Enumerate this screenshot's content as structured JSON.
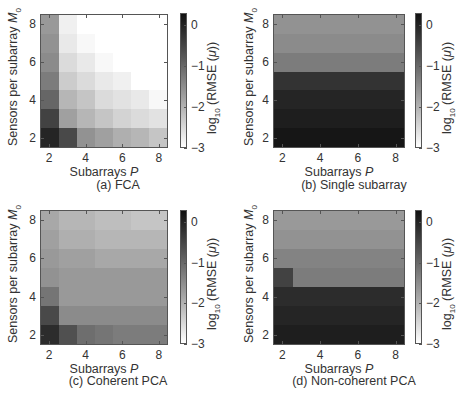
{
  "chart_data": [
    {
      "type": "heatmap",
      "title": "(a) FCA",
      "xlabel": "Subarrays P",
      "ylabel": "Sensors per subarray M0",
      "x": [
        2,
        3,
        4,
        5,
        6,
        7,
        8
      ],
      "y_rows_top_to_bottom": [
        8,
        7,
        6,
        5,
        4,
        3,
        2
      ],
      "xticks": [
        "2",
        "4",
        "6",
        "8"
      ],
      "yticks": [
        "8",
        "6",
        "4",
        "2"
      ],
      "colorbar": {
        "label": "log10 (RMSE (μ))",
        "ticks": [
          "0",
          "−1",
          "−2",
          "−3"
        ],
        "range": [
          -3,
          0.3
        ]
      },
      "values": [
        [
          -1.6,
          -2.8,
          -3.0,
          -3.0,
          -3.0,
          -3.0,
          -3.0
        ],
        [
          -1.5,
          -2.7,
          -2.9,
          -3.0,
          -3.0,
          -3.0,
          -3.0
        ],
        [
          -1.4,
          -2.5,
          -2.7,
          -2.9,
          -3.0,
          -3.0,
          -3.0
        ],
        [
          -1.2,
          -2.3,
          -2.5,
          -2.7,
          -2.8,
          -3.0,
          -3.0
        ],
        [
          -0.9,
          -2.0,
          -2.2,
          -2.5,
          -2.6,
          -2.7,
          -2.9
        ],
        [
          -0.4,
          -1.7,
          -2.0,
          -2.2,
          -2.4,
          -2.5,
          -2.6
        ],
        [
          0.0,
          -0.5,
          -1.5,
          -1.7,
          -1.9,
          -2.0,
          -2.2
        ]
      ]
    },
    {
      "type": "heatmap",
      "title": "(b) Single subarray",
      "xlabel": "Subarrays P",
      "ylabel": "Sensors per subarray M0",
      "x": [
        2,
        3,
        4,
        5,
        6,
        7,
        8
      ],
      "y_rows_top_to_bottom": [
        8,
        7,
        6,
        5,
        4,
        3,
        2
      ],
      "xticks": [
        "2",
        "4",
        "6",
        "8"
      ],
      "yticks": [
        "8",
        "6",
        "4",
        "2"
      ],
      "colorbar": {
        "label": "log10 (RMSE (μ))",
        "ticks": [
          "0",
          "−1",
          "−2",
          "−3"
        ],
        "range": [
          -3,
          0.3
        ]
      },
      "values": [
        [
          -1.5,
          -1.5,
          -1.5,
          -1.5,
          -1.5,
          -1.5,
          -1.5
        ],
        [
          -1.4,
          -1.4,
          -1.4,
          -1.4,
          -1.4,
          -1.4,
          -1.4
        ],
        [
          -1.2,
          -1.2,
          -1.2,
          -1.2,
          -1.2,
          -1.2,
          -1.2
        ],
        [
          -0.2,
          -0.2,
          -0.2,
          -0.2,
          -0.2,
          -0.2,
          -0.2
        ],
        [
          0.0,
          0.0,
          0.0,
          0.0,
          0.0,
          0.0,
          0.0
        ],
        [
          0.1,
          0.1,
          0.1,
          0.1,
          0.1,
          0.1,
          0.1
        ],
        [
          0.2,
          0.2,
          0.2,
          0.2,
          0.2,
          0.2,
          0.2
        ]
      ]
    },
    {
      "type": "heatmap",
      "title": "(c) Coherent PCA",
      "xlabel": "Subarrays P",
      "ylabel": "Sensors per subarray M0",
      "x": [
        2,
        3,
        4,
        5,
        6,
        7,
        8
      ],
      "y_rows_top_to_bottom": [
        8,
        7,
        6,
        5,
        4,
        3,
        2
      ],
      "xticks": [
        "2",
        "4",
        "6",
        "8"
      ],
      "yticks": [
        "8",
        "6",
        "4",
        "2"
      ],
      "colorbar": {
        "label": "log10 (RMSE (μ))",
        "ticks": [
          "0",
          "−1",
          "−2",
          "−3"
        ],
        "range": [
          -3,
          0.3
        ]
      },
      "values": [
        [
          -1.8,
          -2.0,
          -2.0,
          -2.1,
          -2.1,
          -2.2,
          -2.2
        ],
        [
          -1.7,
          -1.9,
          -1.9,
          -2.0,
          -2.0,
          -2.0,
          -2.0
        ],
        [
          -1.6,
          -1.7,
          -1.7,
          -1.8,
          -1.8,
          -1.8,
          -1.8
        ],
        [
          -1.5,
          -1.6,
          -1.6,
          -1.6,
          -1.6,
          -1.6,
          -1.6
        ],
        [
          -1.1,
          -1.6,
          -1.6,
          -1.6,
          -1.6,
          -1.6,
          -1.6
        ],
        [
          -0.5,
          -1.4,
          -1.4,
          -1.4,
          -1.4,
          -1.4,
          -1.4
        ],
        [
          -0.1,
          -0.6,
          -1.0,
          -1.1,
          -1.2,
          -1.2,
          -1.2
        ]
      ]
    },
    {
      "type": "heatmap",
      "title": "(d) Non-coherent PCA",
      "xlabel": "Subarrays P",
      "ylabel": "Sensors per subarray M0",
      "x": [
        2,
        3,
        4,
        5,
        6,
        7,
        8
      ],
      "y_rows_top_to_bottom": [
        8,
        7,
        6,
        5,
        4,
        3,
        2
      ],
      "xticks": [
        "2",
        "4",
        "6",
        "8"
      ],
      "yticks": [
        "8",
        "6",
        "4",
        "2"
      ],
      "colorbar": {
        "label": "log10 (RMSE (μ))",
        "ticks": [
          "0",
          "−1",
          "−2",
          "−3"
        ],
        "range": [
          -3,
          0.3
        ]
      },
      "values": [
        [
          -1.6,
          -1.6,
          -1.6,
          -1.6,
          -1.6,
          -1.6,
          -1.6
        ],
        [
          -1.5,
          -1.5,
          -1.5,
          -1.5,
          -1.5,
          -1.5,
          -1.5
        ],
        [
          -1.3,
          -1.3,
          -1.3,
          -1.3,
          -1.3,
          -1.3,
          -1.3
        ],
        [
          -0.4,
          -1.2,
          -1.2,
          -1.2,
          -1.2,
          -1.2,
          -1.2
        ],
        [
          -0.1,
          -0.1,
          -0.1,
          -0.1,
          -0.1,
          -0.1,
          -0.1
        ],
        [
          0.0,
          0.0,
          0.0,
          0.0,
          0.0,
          0.0,
          0.0
        ],
        [
          0.1,
          0.1,
          0.1,
          0.1,
          0.1,
          0.1,
          0.1
        ]
      ]
    }
  ],
  "labels": {
    "xlabel_text": "Subarrays ",
    "xlabel_var": "P",
    "ylabel_text": "Sensors per subarray ",
    "ylabel_var": "M",
    "ylabel_sub": "0",
    "cb_prefix": "log",
    "cb_sub": "10",
    "cb_suffix": " (RMSE (",
    "cb_var": "μ",
    "cb_close": "))"
  }
}
